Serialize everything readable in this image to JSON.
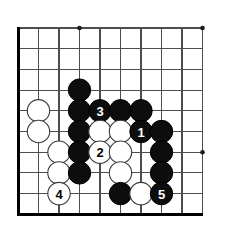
{
  "diagram": {
    "kind": "go-board-diagram",
    "board_region": "bottom-left corner",
    "background_color": "#ffffff",
    "line_color": "#4d4d4d",
    "edge_color": "#000000",
    "black_stone_color": "#0d0d0d",
    "white_stone_color": "#ffffff",
    "black_label_color": "#ffffff",
    "white_label_color": "#000000",
    "geometry": {
      "origin_x": 18,
      "origin_y": 28,
      "spacing_x": 20.5,
      "spacing_y": 20.7,
      "cols": 10,
      "rows": 10,
      "stone_radius": 11.2,
      "star_radius": 2.3
    },
    "edges": [
      {
        "name": "left-border",
        "col": 0
      },
      {
        "name": "bottom-border",
        "row": 9
      }
    ],
    "star_points": [
      {
        "col": 3,
        "row": 0
      },
      {
        "col": 9,
        "row": 0
      },
      {
        "col": 9,
        "row": 6
      }
    ],
    "stones": [
      {
        "name": "black-stone-c3r3",
        "color": "black",
        "col": 3,
        "row": 3,
        "label": ""
      },
      {
        "name": "white-stone-c1r4",
        "color": "white",
        "col": 1,
        "row": 4,
        "label": ""
      },
      {
        "name": "black-stone-c3r4",
        "color": "black",
        "col": 3,
        "row": 4,
        "label": ""
      },
      {
        "name": "black-stone-c4r4",
        "color": "black",
        "col": 4,
        "row": 4,
        "label": "3"
      },
      {
        "name": "black-stone-c5r4",
        "color": "black",
        "col": 5,
        "row": 4,
        "label": ""
      },
      {
        "name": "black-stone-c6r4",
        "color": "black",
        "col": 6,
        "row": 4,
        "label": ""
      },
      {
        "name": "white-stone-c1r5",
        "color": "white",
        "col": 1,
        "row": 5,
        "label": ""
      },
      {
        "name": "black-stone-c3r5",
        "color": "black",
        "col": 3,
        "row": 5,
        "label": ""
      },
      {
        "name": "white-stone-c4r5",
        "color": "white",
        "col": 4,
        "row": 5,
        "label": ""
      },
      {
        "name": "white-stone-c5r5",
        "color": "white",
        "col": 5,
        "row": 5,
        "label": ""
      },
      {
        "name": "black-stone-c6r5",
        "color": "black",
        "col": 6,
        "row": 5,
        "label": "1"
      },
      {
        "name": "black-stone-c7r5",
        "color": "black",
        "col": 7,
        "row": 5,
        "label": ""
      },
      {
        "name": "white-stone-c2r6",
        "color": "white",
        "col": 2,
        "row": 6,
        "label": ""
      },
      {
        "name": "black-stone-c3r6",
        "color": "black",
        "col": 3,
        "row": 6,
        "label": ""
      },
      {
        "name": "white-stone-c4r6",
        "color": "white",
        "col": 4,
        "row": 6,
        "label": "2"
      },
      {
        "name": "white-stone-c5r6",
        "color": "white",
        "col": 5,
        "row": 6,
        "label": ""
      },
      {
        "name": "black-stone-c7r6",
        "color": "black",
        "col": 7,
        "row": 6,
        "label": ""
      },
      {
        "name": "white-stone-c2r7",
        "color": "white",
        "col": 2,
        "row": 7,
        "label": ""
      },
      {
        "name": "black-stone-c3r7",
        "color": "black",
        "col": 3,
        "row": 7,
        "label": ""
      },
      {
        "name": "white-stone-c5r7",
        "color": "white",
        "col": 5,
        "row": 7,
        "label": ""
      },
      {
        "name": "black-stone-c7r7",
        "color": "black",
        "col": 7,
        "row": 7,
        "label": ""
      },
      {
        "name": "white-stone-c2r8",
        "color": "white",
        "col": 2,
        "row": 8,
        "label": "4"
      },
      {
        "name": "black-stone-c5r8",
        "color": "black",
        "col": 5,
        "row": 8,
        "label": ""
      },
      {
        "name": "white-stone-c6r8",
        "color": "white",
        "col": 6,
        "row": 8,
        "label": ""
      },
      {
        "name": "black-stone-c7r8",
        "color": "black",
        "col": 7,
        "row": 8,
        "label": "5"
      }
    ],
    "move_labels": [
      "1",
      "2",
      "3",
      "4",
      "5"
    ]
  }
}
